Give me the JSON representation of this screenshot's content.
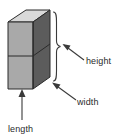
{
  "figure": {
    "kind": "rectangular-prism-dimension-diagram",
    "shape_name": "rectangular prism",
    "background_color": "#ffffff"
  },
  "solid": {
    "top_face_color": "#d9d9d9",
    "front_face_color": "#a9a9a9",
    "side_face_color": "#5c5c5c",
    "edge_color": "#2b2b2b",
    "divider_line_color": "#2b2b2b",
    "has_horizontal_divider": true
  },
  "labels": {
    "height": "height",
    "width": "width",
    "length": "length"
  },
  "annotations": {
    "height_marker": "brace",
    "width_marker": "arrow",
    "length_marker": "arrow",
    "marker_color": "#3a3a3a"
  },
  "cropped_caption": {
    "visible_fragment": ""
  }
}
